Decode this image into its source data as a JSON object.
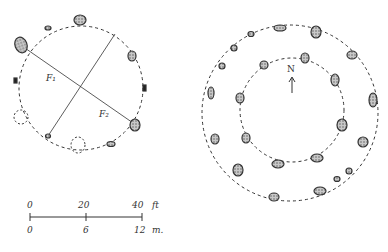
{
  "left_plan": {
    "labels": {
      "f1": "F₁",
      "f2": "F₂"
    }
  },
  "right_plan": {
    "north_label": "N"
  },
  "scale_bar": {
    "feet_ticks": [
      "0",
      "20",
      "40"
    ],
    "feet_unit": "ft",
    "meter_ticks": [
      "0",
      "6",
      "12"
    ],
    "meter_unit": "m."
  },
  "colors": {
    "ink": "#333333",
    "stone_fill": "#9a9a9a"
  }
}
